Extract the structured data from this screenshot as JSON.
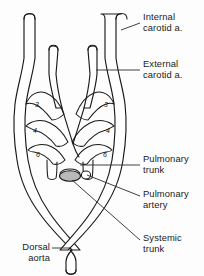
{
  "figure": {
    "type": "anatomical-line-diagram",
    "background_color": "#fdfdfd",
    "line_color": "#1a1a1a",
    "text_color": "#1b1b1b",
    "shaded_fill_color": "#b9b9b9"
  },
  "labels": {
    "internal_carotid": "Internal\ncarotid a.",
    "external_carotid": "External\ncarotid a.",
    "pulmonary_trunk": "Pulmonary\ntrunk",
    "pulmonary_artery": "Pulmonary\nartery",
    "systemic_trunk": "Systemic\ntrunk",
    "dorsal_aorta": "Dorsal aorta"
  },
  "arch_numbers": {
    "left_third": "3",
    "left_fourth": "4",
    "left_sixth": "6",
    "right_third": "3",
    "right_fourth": "4",
    "right_sixth": "6"
  }
}
